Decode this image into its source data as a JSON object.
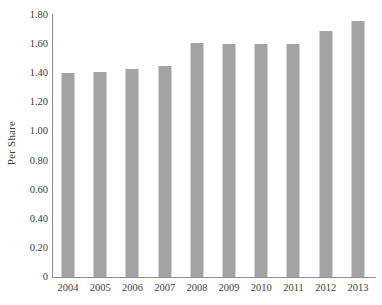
{
  "chart_data": {
    "type": "bar",
    "title": "",
    "subtitle": "",
    "xlabel": "",
    "ylabel": "Per Share",
    "categories": [
      "2004",
      "2005",
      "2006",
      "2007",
      "2008",
      "2009",
      "2010",
      "2011",
      "2012",
      "2013"
    ],
    "values": [
      1.4,
      1.41,
      1.43,
      1.45,
      1.61,
      1.6,
      1.6,
      1.6,
      1.69,
      1.76
    ],
    "series": [
      {
        "name": "Per Share",
        "values": [
          1.4,
          1.41,
          1.43,
          1.45,
          1.61,
          1.6,
          1.6,
          1.6,
          1.69,
          1.76
        ]
      }
    ],
    "ylim": [
      0,
      1.8
    ],
    "y_ticks": [
      "1.80",
      "1.60",
      "1.40",
      "1.20",
      "1.00",
      "0.80",
      "0.60",
      "0.40",
      "0.20",
      "0"
    ],
    "y_tick_values": [
      1.8,
      1.6,
      1.4,
      1.2,
      1.0,
      0.8,
      0.6,
      0.4,
      0.2,
      0
    ],
    "grid": false,
    "legend": null,
    "legend_position": "none",
    "annotations": [],
    "colors": {
      "bar": "#a3a3a3",
      "axis": "#8d8d8d",
      "text": "#3d3d3d",
      "background": "#ffffff"
    }
  }
}
